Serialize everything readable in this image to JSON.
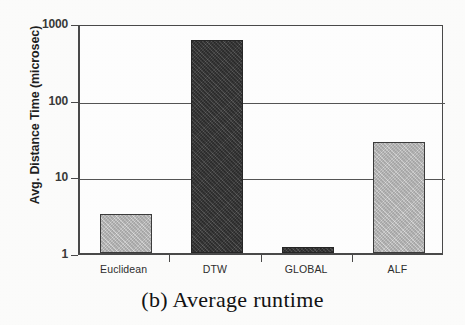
{
  "figure": {
    "caption": "(b)  Average runtime"
  },
  "chart_data": {
    "type": "bar",
    "title": "",
    "xlabel": "",
    "ylabel": "Avg. Distance Time (microsec)",
    "yscale": "log",
    "ylim": [
      1,
      1000
    ],
    "ytick_labels": [
      "1000",
      "100",
      "10",
      "1"
    ],
    "ytick_values": [
      1000,
      100,
      10,
      1
    ],
    "grid": "horizontal",
    "legend": "none",
    "categories": [
      "Euclidean",
      "DTW",
      "GLOBAL",
      "ALF"
    ],
    "values": [
      3.2,
      600,
      1.2,
      28
    ],
    "bar_colors": [
      "#b4b4b4",
      "#3b3b3b",
      "#3b3b3b",
      "#b4b4b4"
    ],
    "units": "microsec"
  }
}
